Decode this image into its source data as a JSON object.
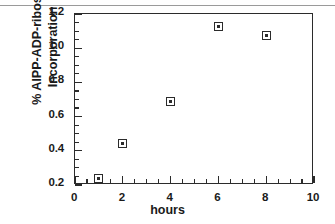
{
  "figure": {
    "background_color": "#ffffff",
    "frame_color": "#2b2b2b",
    "page_rule_color": "#9a9a9a"
  },
  "chart_data": {
    "type": "scatter",
    "title": "",
    "xlabel": "hours",
    "ylabel_lines": [
      "% AlPP-ADP-ribose",
      "Incorporation"
    ],
    "ylabel": "% AlPP-ADP-ribose Incorporation",
    "x": [
      1,
      2,
      4,
      6,
      8
    ],
    "values": [
      0.24,
      0.445,
      0.69,
      1.125,
      1.075
    ],
    "series": [
      {
        "name": "AlPP-ADP-ribose incorporation",
        "points": [
          {
            "x": 1,
            "y": 0.24
          },
          {
            "x": 2,
            "y": 0.445
          },
          {
            "x": 4,
            "y": 0.69
          },
          {
            "x": 6,
            "y": 1.125
          },
          {
            "x": 8,
            "y": 1.075
          }
        ],
        "marker": "open-square-with-center-dot",
        "marker_color": "#2b2b2b"
      }
    ],
    "xlim": [
      0,
      10
    ],
    "ylim": [
      0.2,
      1.2
    ],
    "xticks": [
      0,
      2,
      4,
      6,
      8,
      10
    ],
    "xtick_labels": [
      "0",
      "2",
      "4",
      "6",
      "8",
      "10"
    ],
    "xminor_step": 0.5,
    "yticks": [
      0.2,
      0.4,
      0.6,
      0.8,
      1.0,
      1.2
    ],
    "ytick_labels": [
      "0.2",
      "0.4",
      "0.6",
      "0.8",
      "1.0",
      "1.2"
    ],
    "yminor_step": 0.05,
    "grid": false,
    "legend": null,
    "legend_position": "none",
    "annotations": []
  }
}
